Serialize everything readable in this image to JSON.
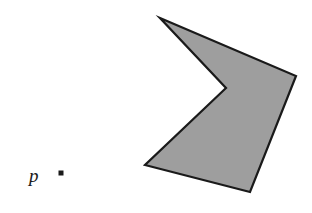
{
  "figure": {
    "background_color": "#ffffff",
    "width": 312,
    "height": 213
  },
  "polygon": {
    "name": "shaded-nonconvex-polygon",
    "fill_color": "#9e9e9e",
    "stroke_color": "#1a1a1a",
    "stroke_width": 2.2,
    "vertex_count": 5,
    "points_attr": "160,18 296,76 250,192 145,165 226,88",
    "vertices": [
      {
        "id": "v1",
        "role": "top-spike-apex",
        "x": 160,
        "y": 18
      },
      {
        "id": "v2",
        "role": "right-upper",
        "x": 296,
        "y": 76
      },
      {
        "id": "v3",
        "role": "bottom-right",
        "x": 250,
        "y": 192
      },
      {
        "id": "v4",
        "role": "bottom-left",
        "x": 145,
        "y": 165
      },
      {
        "id": "v5",
        "role": "reflex-notch",
        "x": 226,
        "y": 88
      }
    ]
  },
  "point_marker": {
    "name": "point-p",
    "label": "p",
    "shape": "square",
    "color": "#1a1a1a",
    "size": 5,
    "x": 61,
    "y": 173,
    "label_x": 29,
    "label_y": 166
  }
}
